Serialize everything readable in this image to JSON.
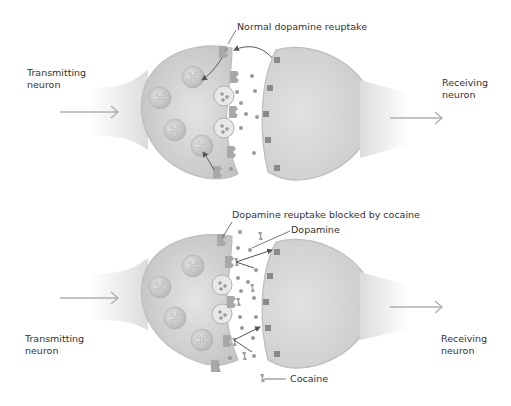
{
  "panels": [
    {
      "id": "normal",
      "title": "Normal dopamine reuptake",
      "left_label_line1": "Transmitting",
      "left_label_line2": "neuron",
      "right_label_line1": "Receiving",
      "right_label_line2": "neuron"
    },
    {
      "id": "blocked",
      "title": "Dopamine reuptake blocked by cocaine",
      "dopamine_label": "Dopamine",
      "cocaine_label": "Cocaine",
      "left_label_line1": "Transmitting",
      "left_label_line2": "neuron",
      "right_label_line1": "Receiving",
      "right_label_line2": "neuron"
    }
  ],
  "colors": {
    "neuron_fill": "#d4d4d4",
    "neuron_edge": "#bdbdbd",
    "vesicle": "#c9c9c9",
    "dopamine_dot": "#9a9a9a",
    "transporter": "#a8a8a8",
    "arrow": "#b0b0b0",
    "pointer": "#555555"
  }
}
